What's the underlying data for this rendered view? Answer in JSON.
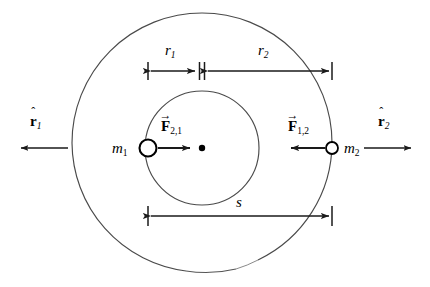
{
  "figure": {
    "background_color": "#ffffff",
    "stroke_color": "#1a1a1a",
    "orbit_stroke_color": "#4a4a4a"
  },
  "geometry": {
    "barycenter": {
      "x": 202,
      "y": 148,
      "dot_radius": 3.2
    },
    "outer_orbit": {
      "cx": 202,
      "cy": 143,
      "r": 130,
      "label": "orbit-of-m2"
    },
    "inner_orbit": {
      "cx": 202,
      "cy": 148,
      "r": 57,
      "label": "orbit-of-m1"
    },
    "body_m1": {
      "x": 148,
      "y": 148,
      "r": 8.5
    },
    "body_m2": {
      "x": 332,
      "y": 148,
      "r": 6.0
    }
  },
  "labels": {
    "m1": {
      "base": "m",
      "sub": "1"
    },
    "m2": {
      "base": "m",
      "sub": "2"
    },
    "r1_dim": {
      "base": "r",
      "sub": "1"
    },
    "r2_dim": {
      "base": "r",
      "sub": "2"
    },
    "s_dim": {
      "base": "s"
    },
    "force_21": {
      "base": "F",
      "sub": "2,1",
      "accent": "vector-arrow"
    },
    "force_12": {
      "base": "F",
      "sub": "1,2",
      "accent": "vector-arrow"
    },
    "rhat1": {
      "base": "r",
      "sub": "1",
      "accent": "hat"
    },
    "rhat2": {
      "base": "r",
      "sub": "2",
      "accent": "hat"
    }
  },
  "dimensions": {
    "r1": {
      "from_x": 148,
      "to_x": 202,
      "y": 71,
      "label": "r1"
    },
    "r2": {
      "from_x": 202,
      "to_x": 332,
      "y": 71,
      "label": "r2"
    },
    "s": {
      "from_x": 148,
      "to_x": 332,
      "y": 216,
      "label": "s"
    }
  },
  "vectors": {
    "force_21": {
      "from_x": 158,
      "to_x": 190,
      "y": 148,
      "direction": "right"
    },
    "force_12": {
      "from_x": 324,
      "to_x": 290,
      "y": 148,
      "direction": "left"
    },
    "rhat1": {
      "from_x": 68,
      "to_x": 20,
      "y": 148,
      "direction": "left"
    },
    "rhat2": {
      "from_x": 364,
      "to_x": 412,
      "y": 148,
      "direction": "right"
    }
  },
  "accent_glyphs": {
    "vector-arrow": "→",
    "hat": "ˆ"
  }
}
